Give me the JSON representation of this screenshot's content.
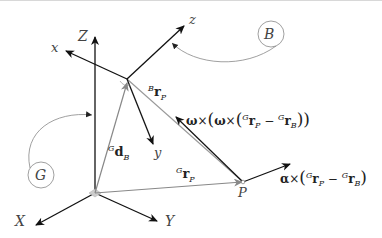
{
  "diagram": {
    "global_frame": {
      "label": "G",
      "axes": {
        "X": "X",
        "Y": "Y",
        "Z": "Z"
      }
    },
    "body_frame": {
      "label": "B",
      "axes": {
        "x": "x",
        "y": "y",
        "z": "z"
      }
    },
    "point": "P",
    "vectors": {
      "d_B": {
        "sup": "G",
        "main": "d",
        "sub": "B"
      },
      "r_P_global": {
        "sup": "G",
        "main": "r",
        "sub": "P"
      },
      "r_P_body": {
        "sup": "B",
        "main": "r",
        "sub": "P"
      }
    },
    "terms": {
      "centripetal": {
        "omega": "ω",
        "times": "×",
        "open1": "(",
        "open2": "(",
        "sup1": "G",
        "r1": "r",
        "sub1": "P",
        "minus": " − ",
        "sup2": "G",
        "r2": "r",
        "sub2": "B",
        "close": "))"
      },
      "tangential": {
        "alpha": "α",
        "times": "×",
        "open": "(",
        "sup1": "G",
        "r1": "r",
        "sub1": "P",
        "minus": " − ",
        "sup2": "G",
        "r2": "r",
        "sub2": "B",
        "close": ")"
      }
    }
  }
}
